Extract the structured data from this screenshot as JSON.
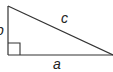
{
  "diagram": {
    "type": "right-triangle",
    "labels": {
      "hypotenuse": "c",
      "base": "a",
      "height": "b"
    },
    "colors": {
      "stroke": "#333333",
      "text": "#222222",
      "background": "#ffffff"
    }
  }
}
